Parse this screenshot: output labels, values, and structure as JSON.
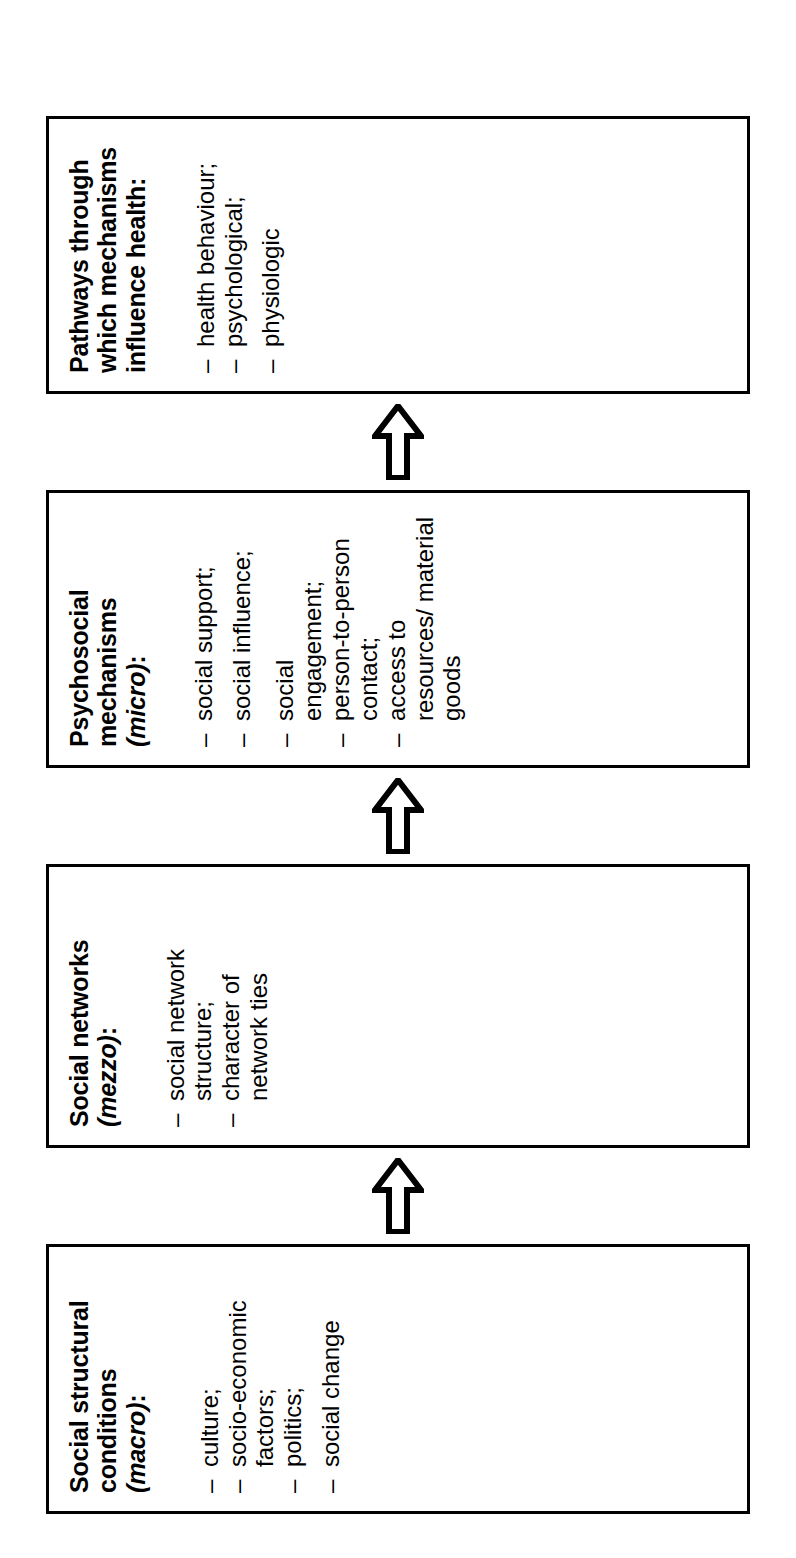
{
  "figure": {
    "orientation": "rotated-90-ccw",
    "flow_direction": "bottom-to-top",
    "arrow_glyph": "hollow-block-arrow-up",
    "stroke_color": "#000000",
    "background_color": "#ffffff",
    "boxes": [
      {
        "id": "macro",
        "title": "Social structural conditions (macro):",
        "title_plain": "Social structural conditions",
        "title_italic": "(macro)",
        "title_suffix": ":",
        "items": [
          "culture;",
          "socio-economic factors;",
          "politics;",
          "social change"
        ]
      },
      {
        "id": "mezzo",
        "title": "Social networks (mezzo):",
        "title_plain": "Social networks",
        "title_italic": "(mezzo)",
        "title_suffix": ":",
        "items": [
          "social network structure;",
          "character of network ties"
        ]
      },
      {
        "id": "micro",
        "title": "Psychosocial mechanisms (micro):",
        "title_plain": "Psychosocial mechanisms",
        "title_italic": "(micro)",
        "title_suffix": ":",
        "items": [
          "social support;",
          "social influence;",
          "social engagement;",
          "person-to-person contact;",
          "access to resources/ material goods"
        ]
      },
      {
        "id": "pathways",
        "title": "Pathways through which mechanisms influence health:",
        "title_plain": "Pathways through which mechanisms influence health:",
        "title_italic": "",
        "title_suffix": "",
        "items": [
          "health behaviour;",
          "psychological;",
          "physiologic"
        ]
      }
    ],
    "arrows": [
      {
        "id": "arrow-macro-to-mezzo",
        "from": "macro",
        "to": "mezzo"
      },
      {
        "id": "arrow-mezzo-to-micro",
        "from": "mezzo",
        "to": "micro"
      },
      {
        "id": "arrow-micro-to-pathways",
        "from": "micro",
        "to": "pathways"
      }
    ]
  }
}
